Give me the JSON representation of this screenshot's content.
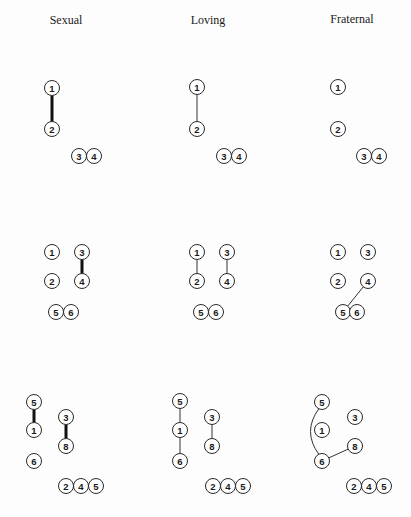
{
  "columns": [
    {
      "title": "Sexual",
      "x": 66,
      "y": 24
    },
    {
      "title": "Loving",
      "x": 208,
      "y": 24
    },
    {
      "title": "Fraternal",
      "x": 352,
      "y": 23
    }
  ],
  "node_radius": 7.5,
  "panels": [
    {
      "id": "row1-sexual",
      "nodes": [
        {
          "label": "1",
          "x": 52,
          "y": 88
        },
        {
          "label": "2",
          "x": 52,
          "y": 129
        },
        {
          "label": "3",
          "x": 79,
          "y": 156
        },
        {
          "label": "4",
          "x": 94,
          "y": 156
        }
      ],
      "edges": [
        {
          "from": 0,
          "to": 1,
          "style": "thick"
        }
      ]
    },
    {
      "id": "row1-loving",
      "nodes": [
        {
          "label": "1",
          "x": 197,
          "y": 87
        },
        {
          "label": "2",
          "x": 197,
          "y": 129
        },
        {
          "label": "3",
          "x": 224,
          "y": 156
        },
        {
          "label": "4",
          "x": 239,
          "y": 156
        }
      ],
      "edges": [
        {
          "from": 0,
          "to": 1,
          "style": "thin"
        }
      ]
    },
    {
      "id": "row1-fraternal",
      "nodes": [
        {
          "label": "1",
          "x": 338,
          "y": 87
        },
        {
          "label": "2",
          "x": 338,
          "y": 129
        },
        {
          "label": "3",
          "x": 364,
          "y": 156
        },
        {
          "label": "4",
          "x": 379,
          "y": 156
        }
      ],
      "edges": []
    },
    {
      "id": "row2-sexual",
      "nodes": [
        {
          "label": "1",
          "x": 52,
          "y": 252
        },
        {
          "label": "3",
          "x": 82,
          "y": 252
        },
        {
          "label": "2",
          "x": 52,
          "y": 281
        },
        {
          "label": "4",
          "x": 82,
          "y": 281
        },
        {
          "label": "5",
          "x": 56,
          "y": 312
        },
        {
          "label": "6",
          "x": 71,
          "y": 312
        }
      ],
      "edges": [
        {
          "from": 1,
          "to": 3,
          "style": "thick"
        }
      ]
    },
    {
      "id": "row2-loving",
      "nodes": [
        {
          "label": "1",
          "x": 197,
          "y": 252
        },
        {
          "label": "3",
          "x": 227,
          "y": 252
        },
        {
          "label": "2",
          "x": 197,
          "y": 281
        },
        {
          "label": "4",
          "x": 227,
          "y": 281
        },
        {
          "label": "5",
          "x": 201,
          "y": 312
        },
        {
          "label": "6",
          "x": 216,
          "y": 312
        }
      ],
      "edges": [
        {
          "from": 0,
          "to": 2,
          "style": "thin"
        },
        {
          "from": 1,
          "to": 3,
          "style": "thin"
        }
      ]
    },
    {
      "id": "row2-fraternal",
      "nodes": [
        {
          "label": "1",
          "x": 338,
          "y": 252
        },
        {
          "label": "3",
          "x": 368,
          "y": 252
        },
        {
          "label": "2",
          "x": 338,
          "y": 281
        },
        {
          "label": "4",
          "x": 368,
          "y": 281
        },
        {
          "label": "5",
          "x": 343,
          "y": 312
        },
        {
          "label": "6",
          "x": 357,
          "y": 312
        }
      ],
      "edges": [
        {
          "from": 3,
          "to": 4,
          "style": "thin"
        }
      ]
    },
    {
      "id": "row3-sexual",
      "nodes": [
        {
          "label": "5",
          "x": 34,
          "y": 402
        },
        {
          "label": "1",
          "x": 34,
          "y": 430
        },
        {
          "label": "6",
          "x": 34,
          "y": 461
        },
        {
          "label": "3",
          "x": 66,
          "y": 417
        },
        {
          "label": "8",
          "x": 66,
          "y": 446
        },
        {
          "label": "2",
          "x": 66,
          "y": 486
        },
        {
          "label": "4",
          "x": 81,
          "y": 486
        },
        {
          "label": "5",
          "x": 96,
          "y": 486
        }
      ],
      "edges": [
        {
          "from": 0,
          "to": 1,
          "style": "thick"
        },
        {
          "from": 3,
          "to": 4,
          "style": "thick"
        }
      ]
    },
    {
      "id": "row3-loving",
      "nodes": [
        {
          "label": "5",
          "x": 180,
          "y": 401
        },
        {
          "label": "1",
          "x": 180,
          "y": 430
        },
        {
          "label": "6",
          "x": 180,
          "y": 461
        },
        {
          "label": "3",
          "x": 212,
          "y": 417
        },
        {
          "label": "8",
          "x": 212,
          "y": 446
        },
        {
          "label": "2",
          "x": 213,
          "y": 486
        },
        {
          "label": "4",
          "x": 228,
          "y": 486
        },
        {
          "label": "5",
          "x": 243,
          "y": 486
        }
      ],
      "edges": [
        {
          "from": 0,
          "to": 1,
          "style": "thin"
        },
        {
          "from": 1,
          "to": 2,
          "style": "thin"
        },
        {
          "from": 3,
          "to": 4,
          "style": "thin"
        }
      ]
    },
    {
      "id": "row3-fraternal",
      "nodes": [
        {
          "label": "5",
          "x": 322,
          "y": 402
        },
        {
          "label": "1",
          "x": 322,
          "y": 430
        },
        {
          "label": "6",
          "x": 322,
          "y": 461
        },
        {
          "label": "3",
          "x": 355,
          "y": 417
        },
        {
          "label": "8",
          "x": 355,
          "y": 446
        },
        {
          "label": "2",
          "x": 354,
          "y": 486
        },
        {
          "label": "4",
          "x": 369,
          "y": 486
        },
        {
          "label": "5",
          "x": 384,
          "y": 486
        }
      ],
      "edges": [
        {
          "from": 0,
          "to": 2,
          "style": "thin",
          "curve": -14
        },
        {
          "from": 2,
          "to": 4,
          "style": "thin"
        }
      ]
    }
  ]
}
